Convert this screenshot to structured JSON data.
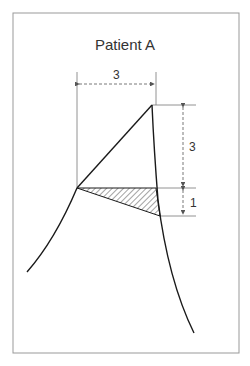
{
  "title": "Patient A",
  "labels": {
    "horizontal_dimension": "3",
    "vertical_upper_dimension": "3",
    "vertical_lower_dimension": "1"
  },
  "colors": {
    "line": "#1a1a1a",
    "frame": "#999999",
    "dimension": "#555555",
    "text": "#333333"
  },
  "shapes": {
    "apex": [
      152,
      105
    ],
    "left_vertex": [
      77,
      188
    ],
    "hatched_triangle": [
      [
        77,
        188
      ],
      [
        156,
        188
      ],
      [
        160,
        216
      ]
    ]
  }
}
